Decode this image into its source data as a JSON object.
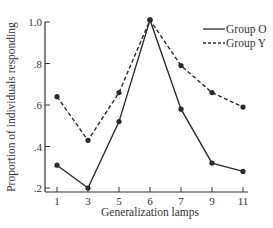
{
  "chart_data": {
    "type": "line",
    "title": "",
    "xlabel": "Generalization lamps",
    "ylabel": "Proportion of individuals responding",
    "categories": [
      "1",
      "3",
      "5",
      "6",
      "7",
      "9",
      "11"
    ],
    "series": [
      {
        "name": "Group O",
        "style": "solid",
        "values": [
          0.31,
          0.2,
          0.52,
          1.01,
          0.58,
          0.32,
          0.28
        ]
      },
      {
        "name": "Group Y",
        "style": "dashed",
        "values": [
          0.64,
          0.43,
          0.66,
          1.01,
          0.79,
          0.66,
          0.59
        ]
      }
    ],
    "y_ticks": [
      ".2",
      ".4",
      ".6",
      ".8",
      "1.0"
    ],
    "ylim": [
      0.2,
      1.0
    ],
    "grid": false,
    "legend_position": "upper right",
    "colors": {
      "line": "#2a2a2a",
      "background": "#ffffff"
    }
  },
  "legend": {
    "items": [
      {
        "label": "Group O"
      },
      {
        "label": "Group Y"
      }
    ]
  },
  "axes": {
    "xlabel": "Generalization lamps",
    "ylabel": "Proportion of individuals responding"
  }
}
